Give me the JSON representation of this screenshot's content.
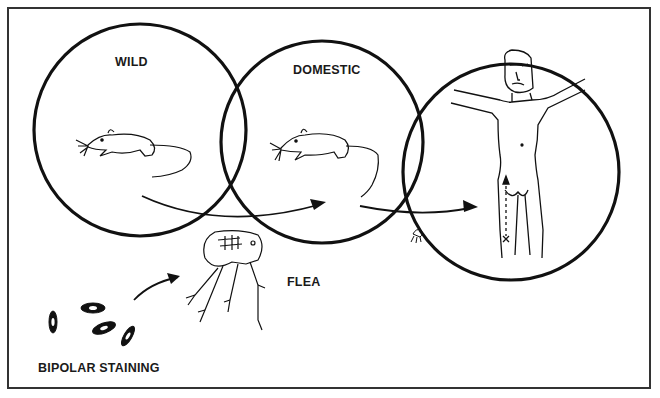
{
  "diagram": {
    "type": "transmission-cycle",
    "labels": {
      "wild": "WILD",
      "domestic": "DOMESTIC",
      "flea": "FLEA",
      "bipolar_staining": "BIPOLAR STAINING"
    },
    "nodes": [
      {
        "id": "wild",
        "label": "WILD",
        "figure": "rat"
      },
      {
        "id": "domestic",
        "label": "DOMESTIC",
        "figure": "rat"
      },
      {
        "id": "human",
        "label": "",
        "figure": "human"
      },
      {
        "id": "flea",
        "label": "FLEA",
        "figure": "flea"
      },
      {
        "id": "bacteria",
        "label": "BIPOLAR STAINING",
        "figure": "bacilli"
      }
    ],
    "edges": [
      {
        "from": "wild",
        "to": "domestic"
      },
      {
        "from": "domestic",
        "to": "human"
      },
      {
        "from": "bacteria",
        "to": "flea"
      }
    ],
    "colors": {
      "ink": "#111111",
      "frame": "#333333",
      "background": "#ffffff"
    }
  }
}
